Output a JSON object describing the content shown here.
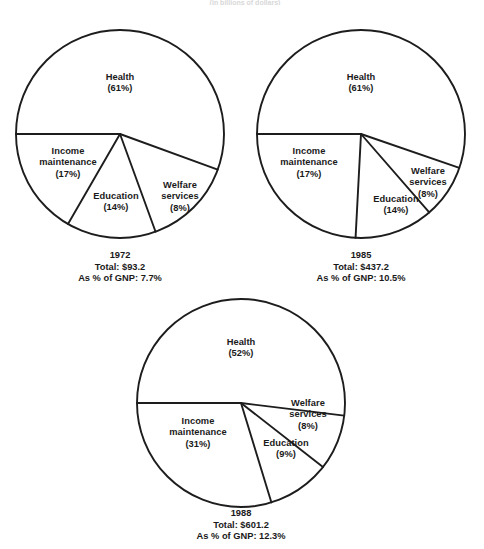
{
  "figure": {
    "title_fragment": "(in billions of dollars)",
    "background": "#ffffff",
    "line_color": "#1d1d1d",
    "text_color": "#1a1a1a"
  },
  "chart_data": [
    {
      "type": "pie",
      "title": "1972",
      "id": "pie-1972",
      "categories": [
        "Health",
        "Income maintenance",
        "Education",
        "Welfare services"
      ],
      "values": [
        61,
        17,
        14,
        8
      ],
      "labels": [
        "Health\n(61%)",
        "Income maintenance\n(17%)",
        "Education\n(14%)",
        "Welfare services\n(8%)"
      ],
      "slices": [
        {
          "name": "Health",
          "label": "Health",
          "percent_text": "(61%)",
          "value": 61,
          "start_deg": 340,
          "end_deg": 180
        },
        {
          "name": "Income maintenance",
          "label_line1": "Income",
          "label_line2": "maintenance",
          "percent_text": "(17%)",
          "value": 17,
          "start_deg": 180,
          "end_deg": 240
        },
        {
          "name": "Education",
          "label": "Education",
          "percent_text": "(14%)",
          "value": 14,
          "start_deg": 240,
          "end_deg": 290
        },
        {
          "name": "Welfare services",
          "label_line1": "Welfare",
          "label_line2": "services",
          "percent_text": "(8%)",
          "value": 8,
          "start_deg": 290,
          "end_deg": 340
        }
      ],
      "caption": {
        "year": "1972",
        "total": "Total: $93.2",
        "gnp": "As % of GNP: 7.7%"
      }
    },
    {
      "type": "pie",
      "title": "1985",
      "id": "pie-1985",
      "categories": [
        "Health",
        "Income maintenance",
        "Education",
        "Welfare services"
      ],
      "values": [
        61,
        17,
        14,
        8
      ],
      "labels": [
        "Health\n(61%)",
        "Income maintenance\n(17%)",
        "Education\n(14%)",
        "Welfare services\n(8%)"
      ],
      "slices": [
        {
          "name": "Health",
          "label": "Health",
          "percent_text": "(61%)",
          "value": 61,
          "start_deg": 341,
          "end_deg": 180
        },
        {
          "name": "Income maintenance",
          "label_line1": "Income",
          "label_line2": "maintenance",
          "percent_text": "(17%)",
          "value": 17,
          "start_deg": 180,
          "end_deg": 267
        },
        {
          "name": "Education",
          "label": "Education",
          "percent_text": "(14%)",
          "value": 14,
          "start_deg": 267,
          "end_deg": 311
        },
        {
          "name": "Welfare services",
          "label_line1": "Welfare",
          "label_line2": "services",
          "percent_text": "(8%)",
          "value": 8,
          "start_deg": 311,
          "end_deg": 341
        }
      ],
      "caption": {
        "year": "1985",
        "total": "Total: $437.2",
        "gnp": "As % of GNP: 10.5%"
      }
    },
    {
      "type": "pie",
      "title": "1988",
      "id": "pie-1988",
      "categories": [
        "Health",
        "Income maintenance",
        "Education",
        "Welfare services"
      ],
      "values": [
        52,
        31,
        9,
        8
      ],
      "labels": [
        "Health\n(52%)",
        "Income maintenance\n(31%)",
        "Education\n(9%)",
        "Welfare services\n(8%)"
      ],
      "slices": [
        {
          "name": "Health",
          "label": "Health",
          "percent_text": "(52%)",
          "value": 52,
          "start_deg": 353,
          "end_deg": 180
        },
        {
          "name": "Income maintenance",
          "label_line1": "Income",
          "label_line2": "maintenance",
          "percent_text": "(31%)",
          "value": 31,
          "start_deg": 180,
          "end_deg": 287
        },
        {
          "name": "Education",
          "label": "Education",
          "percent_text": "(9%)",
          "value": 9,
          "start_deg": 287,
          "end_deg": 322
        },
        {
          "name": "Welfare services",
          "label_line1": "Welfare",
          "label_line2": "services",
          "percent_text": "(8%)",
          "value": 8,
          "start_deg": 322,
          "end_deg": 353
        }
      ],
      "caption": {
        "year": "1988",
        "total": "Total: $601.2",
        "gnp": "As % of GNP: 12.3%"
      }
    }
  ]
}
